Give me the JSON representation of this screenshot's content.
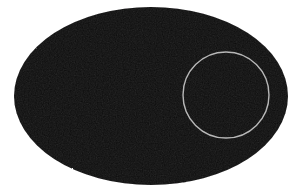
{
  "figure": {
    "background_color": "#ffffff",
    "width": 298,
    "height": 194,
    "shapes": [
      {
        "name": "ellipse",
        "type": "ellipse",
        "center_x": 151,
        "center_y": 96,
        "radius_x": 137,
        "radius_y": 89,
        "fill_color": "#100f10",
        "stroke_color": "none",
        "stroke_width": 0,
        "texture": "scanned-grain"
      },
      {
        "name": "circle-outline",
        "type": "circle",
        "center_x": 226,
        "center_y": 95,
        "radius": 43,
        "fill_color": "none",
        "stroke_color": "#b8b8b8",
        "stroke_width": 1.4
      }
    ]
  },
  "chart_data": {
    "type": "diagram",
    "xlabel": "",
    "ylabel": "",
    "elements": [
      {
        "label": "ellipse",
        "shape": "ellipse",
        "cx": 151,
        "cy": 96,
        "rx": 137,
        "ry": 89,
        "fill": "#100f10"
      },
      {
        "label": "circle",
        "shape": "circle",
        "cx": 226,
        "cy": 95,
        "r": 43,
        "fill": "none",
        "stroke": "#b8b8b8"
      }
    ]
  }
}
